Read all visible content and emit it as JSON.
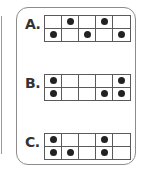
{
  "options": [
    {
      "label": "A.",
      "rows": 2,
      "cols": 5,
      "grid": [
        [
          0,
          1,
          0,
          1,
          0
        ],
        [
          1,
          0,
          1,
          0,
          1
        ]
      ]
    },
    {
      "label": "B.",
      "rows": 2,
      "cols": 5,
      "grid": [
        [
          1,
          0,
          0,
          0,
          1
        ],
        [
          1,
          0,
          0,
          1,
          1
        ]
      ]
    },
    {
      "label": "C.",
      "rows": 2,
      "cols": 5,
      "grid": [
        [
          1,
          0,
          0,
          1,
          0
        ],
        [
          1,
          1,
          0,
          1,
          0
        ]
      ]
    }
  ],
  "colors": {
    "dot": "#222222",
    "grid_line": "#5a5a5a",
    "card_border": "#8c8c8c"
  }
}
